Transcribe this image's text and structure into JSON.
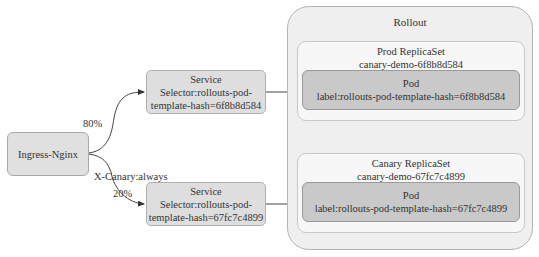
{
  "diagram": {
    "ingress": {
      "label": "Ingress-Nginx"
    },
    "services": [
      {
        "title": "Service",
        "line1": "Selector:rollouts-pod-",
        "line2": "template-hash=6f8b8d584"
      },
      {
        "title": "Service",
        "line1": "Selector:rollouts-pod-",
        "line2": "template-hash=67fc7c4899"
      }
    ],
    "edges": {
      "stable_weight": "80%",
      "canary_header": "X-Canary:always",
      "canary_weight": "20%"
    },
    "rollout": {
      "title": "Rollout",
      "replicasets": [
        {
          "title": "Prod ReplicaSet",
          "name": "canary-demo-6f8b8d584",
          "pod": {
            "title": "Pod",
            "label": "label:rollouts-pod-template-hash=6f8b8d584"
          }
        },
        {
          "title": "Canary ReplicaSet",
          "name": "canary-demo-67fc7c4899",
          "pod": {
            "title": "Pod",
            "label": "label:rollouts-pod-template-hash=67fc7c4899"
          }
        }
      ]
    }
  }
}
